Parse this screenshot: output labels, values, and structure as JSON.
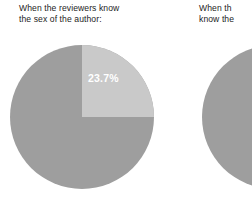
{
  "figure": {
    "background_color": "#ffffff",
    "slice_color": "#9e9e9e",
    "highlight_color": "#c9c9c9",
    "label_color": "#ffffff",
    "caption_color": "#1c1c1c"
  },
  "charts": [
    {
      "caption_line1": "When the reviewers know",
      "caption_line2": "the sex of the author:",
      "label": "23.7%"
    },
    {
      "caption_line1": "When th",
      "caption_line2": "know the",
      "label": ""
    }
  ],
  "chart_data": [
    {
      "type": "pie",
      "title": "When the reviewers know the sex of the author:",
      "categories": [
        "Highlighted share",
        "Remainder"
      ],
      "values": [
        23.7,
        76.3
      ],
      "value_unit": "%",
      "labels": [
        "23.7%",
        ""
      ],
      "colors": [
        "#c9c9c9",
        "#9e9e9e"
      ],
      "start_angle": 0,
      "direction": "clockwise",
      "legend": "none",
      "grid": false,
      "notes": "Pie is cropped at the bottom edge of the image."
    },
    {
      "type": "pie",
      "title": "When th... know the...",
      "categories": [
        "Remainder"
      ],
      "values": [
        100
      ],
      "value_unit": "%",
      "labels": [
        ""
      ],
      "colors": [
        "#9e9e9e"
      ],
      "start_angle": 0,
      "direction": "clockwise",
      "legend": "none",
      "grid": false,
      "notes": "Chart and caption are clipped by the right edge of the image; only the left sliver of the pie is visible and no wedge boundary is shown."
    }
  ]
}
